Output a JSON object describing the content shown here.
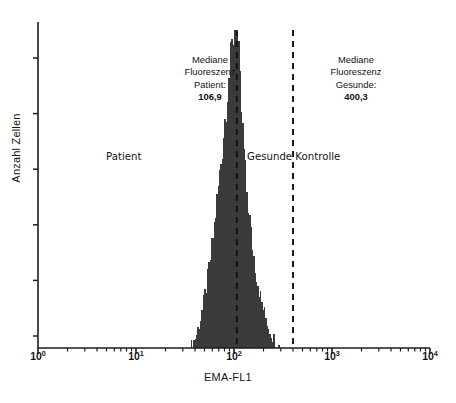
{
  "figure": {
    "width": 456,
    "height": 403,
    "background": "#ffffff"
  },
  "annotations": {
    "median_patient": {
      "line1": "Mediane",
      "line2": "Fluoreszenz",
      "line3": "Patient:",
      "value": "106,9"
    },
    "median_healthy": {
      "line1": "Mediane",
      "line2": "Fluoreszenz",
      "line3": "Gesunde:",
      "value": "400,3"
    },
    "group_patient": "Patient",
    "group_healthy": "Gesunde Kontrolle"
  },
  "chart_data": {
    "type": "area",
    "title": "",
    "subtitle": "",
    "xlabel": "EMA-FL1",
    "ylabel": "Anzahl Zellen",
    "xscale": "log",
    "xlim": [
      1,
      10000
    ],
    "ylim": [
      0,
      100
    ],
    "grid": false,
    "legend_position": "none",
    "xtick_labels": [
      "10",
      "10",
      "10",
      "10",
      "10"
    ],
    "xtick_exponents": [
      "0",
      "1",
      "2",
      "3",
      "4"
    ],
    "xtick_values": [
      1,
      10,
      100,
      1000,
      10000
    ],
    "xminor_ticks": true,
    "ytick_count": 6,
    "ytick_labels": [
      "",
      "",
      "",
      "",
      "",
      ""
    ],
    "series": [
      {
        "name": "Patient EMA fluorescence",
        "fill_color": "#3b3b3b",
        "median": 106.9,
        "comment": "Log-normal histogram of cell counts vs EMA-FL1 fluorescence; right-skewed, peak at median 106.9",
        "x": [
          35,
          37,
          39,
          41,
          43,
          45,
          47,
          49,
          52,
          55,
          58,
          61,
          64,
          67,
          70,
          73,
          76,
          79,
          82,
          85,
          88,
          91,
          94,
          97,
          100,
          103,
          106,
          109,
          112,
          115,
          119,
          123,
          127,
          131,
          136,
          141,
          146,
          152,
          158,
          165,
          172,
          180,
          189,
          199,
          210,
          222,
          235,
          250,
          265,
          280,
          295
        ],
        "y": [
          0,
          1.2,
          2.6,
          4.3,
          6.5,
          9.0,
          12.0,
          15.5,
          20.0,
          25.0,
          30.5,
          36.0,
          41.5,
          47.0,
          52.5,
          58.0,
          63.5,
          69.0,
          74.0,
          79.0,
          84.0,
          88.5,
          92.5,
          96.0,
          99.0,
          100.0,
          96.5,
          90.0,
          83.0,
          76.0,
          69.0,
          62.5,
          56.0,
          50.0,
          44.5,
          39.5,
          35.0,
          30.5,
          26.5,
          23.0,
          19.5,
          16.5,
          13.5,
          11.0,
          8.5,
          6.5,
          4.5,
          3.0,
          1.8,
          0.8,
          0
        ]
      }
    ],
    "vertical_lines": [
      {
        "name": "median-patient-line",
        "value": 106.9,
        "style": "dashed",
        "color": "#111111",
        "label": "106,9"
      },
      {
        "name": "median-healthy-line",
        "value": 400.3,
        "style": "dashed",
        "color": "#111111",
        "label": "400,3"
      }
    ]
  }
}
